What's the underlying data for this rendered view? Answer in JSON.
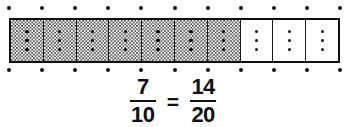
{
  "figure": {
    "name": "fraction-bar-equivalence-model"
  },
  "bar_model": {
    "total_cells": 10,
    "shaded_cells": 7,
    "unshaded_cells": 3,
    "subdivisions_per_cell": 2,
    "total_subdivisions": 20,
    "shaded_subdivisions": 14,
    "cells": [
      {
        "index": 1,
        "shaded": true
      },
      {
        "index": 2,
        "shaded": true
      },
      {
        "index": 3,
        "shaded": true
      },
      {
        "index": 4,
        "shaded": true
      },
      {
        "index": 5,
        "shaded": true
      },
      {
        "index": 6,
        "shaded": true
      },
      {
        "index": 7,
        "shaded": true
      },
      {
        "index": 8,
        "shaded": false
      },
      {
        "index": 9,
        "shaded": false
      },
      {
        "index": 10,
        "shaded": false
      }
    ],
    "midline_dots_per_cell": 3,
    "tick_dot_count": 11,
    "tick_dot_positions_pct": [
      0,
      10,
      20,
      30,
      40,
      50,
      60,
      70,
      80,
      90,
      100
    ]
  },
  "equation": {
    "left_fraction": {
      "numerator": "7",
      "denominator": "10"
    },
    "operator": "=",
    "right_fraction": {
      "numerator": "14",
      "denominator": "20"
    },
    "plain_text": "7/10 = 14/20"
  },
  "colors": {
    "background": "#ffffff",
    "outline": "#101010",
    "divider": "#1a1a1a",
    "shading": "#4a4a4a",
    "text": "#111111",
    "dot": "#101010"
  }
}
